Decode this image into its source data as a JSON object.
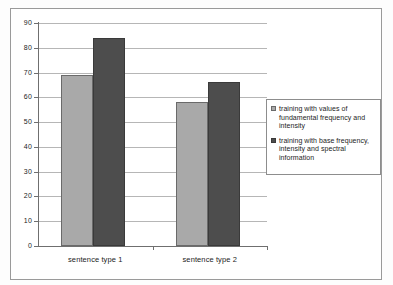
{
  "chart_data": {
    "type": "bar",
    "title": "",
    "subtitle": "",
    "xlabel": "",
    "ylabel": "",
    "categories": [
      "sentence type 1",
      "sentence type 2"
    ],
    "series": [
      {
        "name": "training with values of fundamental frequency and intensity",
        "color": "#a9a9a9",
        "values": [
          69,
          58
        ]
      },
      {
        "name": "training with base frequency, intensity and spectral information",
        "color": "#4d4d4d",
        "values": [
          84,
          66
        ]
      }
    ],
    "ylim": [
      0,
      90
    ],
    "ytick_step": 10,
    "yticks": [
      "0",
      "10",
      "20",
      "30",
      "40",
      "50",
      "60",
      "70",
      "80",
      "90"
    ],
    "grid": true,
    "legend_position": "right"
  },
  "legend": {
    "entries": [
      {
        "label": "training with values of fundamental frequency and intensity"
      },
      {
        "label": "training with base frequency, intensity and spectral information"
      }
    ]
  }
}
